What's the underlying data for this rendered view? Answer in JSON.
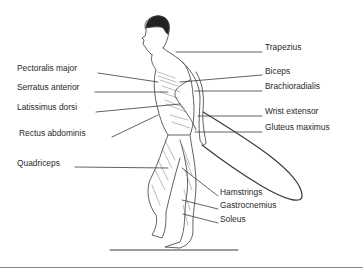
{
  "figure": {
    "labels_left": [
      {
        "text": "Pectoralis major",
        "x": 17,
        "y": 68
      },
      {
        "text": "Serratus anterior",
        "x": 17,
        "y": 87
      },
      {
        "text": "Latissimus dorsi",
        "x": 17,
        "y": 107
      },
      {
        "text": "Rectus abdominis",
        "x": 19,
        "y": 133
      },
      {
        "text": "Quadriceps",
        "x": 17,
        "y": 163
      }
    ],
    "labels_right": [
      {
        "text": "Trapezius",
        "x": 265,
        "y": 47
      },
      {
        "text": "Biceps",
        "x": 265,
        "y": 71
      },
      {
        "text": "Brachioradialis",
        "x": 265,
        "y": 86
      },
      {
        "text": "Wrist extensor",
        "x": 265,
        "y": 111
      },
      {
        "text": "Gluteus maximus",
        "x": 265,
        "y": 127
      },
      {
        "text": "Hamstrings",
        "x": 220,
        "y": 192
      },
      {
        "text": "Gastrocnemius",
        "x": 220,
        "y": 205
      },
      {
        "text": "Soleus",
        "x": 220,
        "y": 219
      }
    ],
    "colors": {
      "line": "#3a3a3a",
      "text": "#2a2a2a",
      "rule": "#8a8a8a"
    }
  }
}
